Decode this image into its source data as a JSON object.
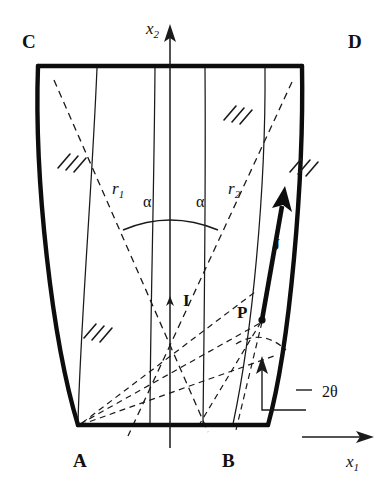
{
  "figure": {
    "background_color": "#ffffff",
    "ink_color": "#111111"
  },
  "corner_labels": [
    {
      "id": "C",
      "text": "C",
      "x": 22,
      "y": 48
    },
    {
      "id": "D",
      "text": "D",
      "x": 348,
      "y": 48
    },
    {
      "id": "A",
      "text": "A",
      "x": 73,
      "y": 467
    },
    {
      "id": "B",
      "text": "B",
      "x": 222,
      "y": 467
    }
  ],
  "point_labels": [
    {
      "id": "I",
      "text": "I",
      "x": 183,
      "y": 306
    },
    {
      "id": "P",
      "text": "P",
      "x": 237,
      "y": 318
    }
  ],
  "vector_labels": [
    {
      "id": "J",
      "text": "J",
      "x": 272,
      "y": 250
    }
  ],
  "axes": [
    {
      "id": "x2",
      "text": "x",
      "sub": "2",
      "x": 146,
      "y": 34,
      "direction": "up"
    },
    {
      "id": "x1",
      "text": "x",
      "sub": "1",
      "x": 346,
      "y": 467,
      "direction": "right"
    }
  ],
  "radius_labels": [
    {
      "id": "r1",
      "text": "r",
      "sub": "1",
      "x": 112,
      "y": 194
    },
    {
      "id": "r2",
      "text": "r",
      "sub": "2",
      "x": 228,
      "y": 194
    }
  ],
  "angle_labels": [
    {
      "id": "alpha-left",
      "text": "α",
      "x": 143,
      "y": 207
    },
    {
      "id": "alpha-right",
      "text": "α",
      "x": 196,
      "y": 207
    },
    {
      "id": "two-theta",
      "text": "2θ",
      "x": 322,
      "y": 391
    }
  ],
  "geometry": {
    "top_edge": {
      "x1": 38,
      "y1": 66,
      "x2": 302,
      "y2": 66
    },
    "bottom_edge": {
      "x1": 78,
      "y1": 425,
      "x2": 268,
      "y2": 425
    },
    "left_side_curve": "M 38 66 C 34 180 52 340 78 425",
    "right_side_curve": "M 302 66 C 304 180 290 345 268 425",
    "interior_lines": [
      "M 97 68 C 92 190 80 330 78 424",
      "M 155 68 C 154 200 150 330 150 424",
      "M 205 68 C 206 200 204 330 203 424",
      "M 265 68 C 266 190 252 335 233 424"
    ],
    "axis_vertical": {
      "x": 170,
      "y1": 40,
      "y2": 448
    },
    "dashed_rays": [
      "M 54 80 L 208 432",
      "M 292 82 L 128 436"
    ],
    "fan_rays_left": [
      "M 80 424 L 262 320",
      "M 80 424 L 272 352",
      "M 82 423 L 255 290"
    ],
    "fan_rays_right": [
      "M 262 320 L 196 430",
      "M 262 320 L 232 430"
    ],
    "arc_alpha": "M 123 230 Q 170 210 218 230",
    "arc_theta": "M 238 344 Q 262 330 285 348"
  },
  "hatch_groups": [
    {
      "id": "hatch-upper-right",
      "x": 228,
      "y": 115
    },
    {
      "id": "hatch-mid-left",
      "x": 62,
      "y": 162
    },
    {
      "id": "hatch-mid-right",
      "x": 294,
      "y": 165
    },
    {
      "id": "hatch-lower-left",
      "x": 88,
      "y": 332
    }
  ],
  "annotation": {
    "theta_arrow": {
      "x": 262,
      "y_tail": 396,
      "y_head": 362
    },
    "leader_path": "M 262 396 L 262 408 L 300 408 L 312 390"
  }
}
